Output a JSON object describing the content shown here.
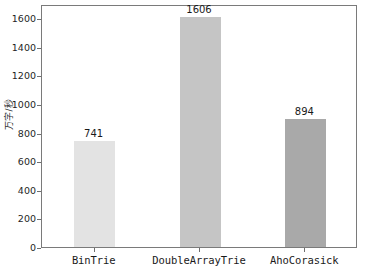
{
  "chart_data": {
    "type": "bar",
    "title": "",
    "subtitle": "",
    "xlabel": "",
    "ylabel": "万字/秒",
    "categories": [
      "BinTrie",
      "DoubleArrayTrie",
      "AhoCorasick"
    ],
    "values": [
      741,
      1606,
      894
    ],
    "value_labels": [
      "741",
      "1606",
      "894"
    ],
    "ylim": [
      0,
      1700
    ],
    "xlim": [
      0,
      3
    ],
    "yticks": [
      0,
      200,
      400,
      600,
      800,
      1000,
      1200,
      1400,
      1600
    ],
    "ytick_labels": [
      "0",
      "200",
      "400",
      "600",
      "800",
      "1000",
      "1200",
      "1400",
      "1600"
    ],
    "grid": false,
    "legend": false,
    "legend_position": "none",
    "bar_colors": [
      "#e3e3e3",
      "#c5c5c5",
      "#a9a9a9"
    ],
    "bar_edge_colors": [
      "#d8d8d8",
      "#bcbcbc",
      "#a0a0a0"
    ],
    "series": [
      {
        "name": "throughput",
        "values": [
          741,
          1606,
          894
        ]
      }
    ],
    "annotations": [
      {
        "text": "741",
        "category": "BinTrie",
        "value": 741
      },
      {
        "text": "1606",
        "category": "DoubleArrayTrie",
        "value": 1606
      },
      {
        "text": "894",
        "category": "AhoCorasick",
        "value": 894
      }
    ]
  },
  "style": {
    "frame_color": "#7a7a7a",
    "tick_color": "#6e6e6e",
    "text_color": "#1a1a1a",
    "background": "#ffffff"
  }
}
